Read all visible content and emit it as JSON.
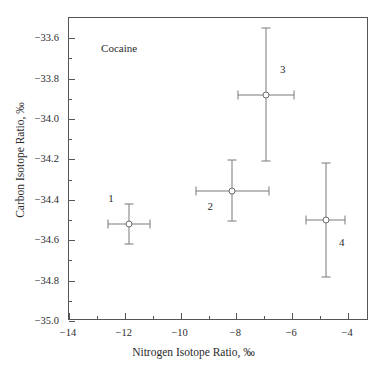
{
  "chart_data": {
    "type": "scatter",
    "title": "",
    "annotation": "Cocaine",
    "xlabel": "Nitrogen Isotope Ratio, ‰",
    "ylabel": "Carbon Isotope Ratio, ‰",
    "xlim": [
      -14,
      -3.25
    ],
    "ylim": [
      -35.0,
      -33.5
    ],
    "grid": false,
    "legend": "none",
    "xticks": [
      -14,
      -12,
      -10,
      -8,
      -6,
      -4
    ],
    "xticklabels": [
      "−14",
      "−12",
      "−10",
      "−8",
      "−6",
      "−4"
    ],
    "xminorticks": [
      -13,
      -11,
      -9,
      -7,
      -5
    ],
    "yticks": [
      -33.6,
      -33.8,
      -34.0,
      -34.2,
      -34.4,
      -34.6,
      -34.8,
      -35.0
    ],
    "yticklabels": [
      "−33.6",
      "−33.8",
      "−34.0",
      "−34.2",
      "−34.4",
      "−34.6",
      "−34.8",
      "−35.0"
    ],
    "yminorticks": [
      -33.7,
      -33.9,
      -34.1,
      -34.3,
      -34.5,
      -34.7,
      -34.9
    ],
    "marker": "open-circle",
    "points": [
      {
        "label": "1",
        "x": -11.85,
        "y": -34.52,
        "xerr": 0.75,
        "yerr": 0.1,
        "label_dx": -18,
        "label_dy": -26
      },
      {
        "label": "2",
        "x": -8.15,
        "y": -34.355,
        "xerr": 1.3,
        "yerr": 0.15,
        "label_dx": -22,
        "label_dy": 15
      },
      {
        "label": "3",
        "x": -6.95,
        "y": -33.88,
        "xerr": 1.0,
        "yerr": 0.33,
        "label_dx": 17,
        "label_dy": -26
      },
      {
        "label": "4",
        "x": -4.8,
        "y": -34.5,
        "xerr": 0.7,
        "yerr": 0.28,
        "label_dx": 16,
        "label_dy": 22
      }
    ]
  },
  "colors": {
    "axis": "#555555",
    "marker_edge": "#6b6b6b",
    "errorbar": "#7a7a7a",
    "text": "#2b2b2b",
    "background": "#ffffff"
  }
}
